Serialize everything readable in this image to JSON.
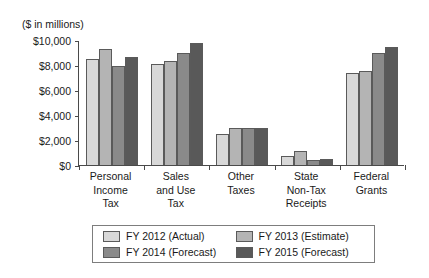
{
  "chart_data": {
    "type": "bar",
    "title": "",
    "subtitle": "",
    "unit_label": "($ in millions)",
    "xlabel": "",
    "ylabel": "",
    "ylim": [
      0,
      10000
    ],
    "ytick_values": [
      0,
      2000,
      4000,
      6000,
      8000,
      10000
    ],
    "ytick_labels": [
      "$0",
      "$2,000",
      "$4,000",
      "$6,000",
      "$8,000",
      "$10,000"
    ],
    "grid": false,
    "legend_position": "bottom",
    "categories": [
      "Personal\nIncome\nTax",
      "Sales\nand Use\nTax",
      "Other\nTaxes",
      "State\nNon-Tax\nReceipts",
      "Federal\nGrants"
    ],
    "series": [
      {
        "name": "FY 2012 (Actual)",
        "color": "#d8d8d8",
        "values": [
          8500,
          8050,
          2450,
          700,
          7350
        ]
      },
      {
        "name": "FY 2013 (Estimate)",
        "color": "#b4b4b4",
        "values": [
          9250,
          8300,
          2950,
          1150,
          7550
        ]
      },
      {
        "name": "FY 2014 (Forecast)",
        "color": "#8a8a8a",
        "values": [
          7900,
          9000,
          2950,
          420,
          9000
        ]
      },
      {
        "name": "FY 2015 (Forecast)",
        "color": "#595959",
        "values": [
          8650,
          9800,
          2950,
          450,
          9450
        ]
      }
    ]
  },
  "colors": {
    "axis": "#4a4a4a",
    "bar_outline": "#5a5a5a",
    "legend_border": "#7d7d7d",
    "background": "#ffffff"
  }
}
